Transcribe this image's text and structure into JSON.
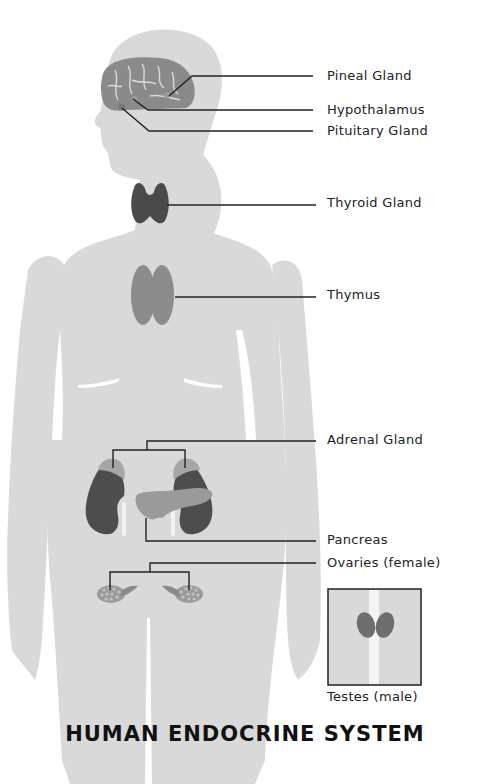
{
  "title": "HUMAN ENDOCRINE SYSTEM",
  "labels": {
    "pineal": "Pineal Gland",
    "hypothalamus": "Hypothalamus",
    "pituitary": "Pituitary Gland",
    "thyroid": "Thyroid Gland",
    "thymus": "Thymus",
    "adrenal": "Adrenal Gland",
    "pancreas": "Pancreas",
    "ovaries": "Ovaries (female)",
    "testes": "Testes (male)"
  },
  "colors": {
    "silhouette": "#d9d9d9",
    "brain": "#8a8a8a",
    "thyroid": "#4a4a4a",
    "thymus": "#8c8c8c",
    "kidney": "#4d4d4d",
    "adrenal": "#a6a6a6",
    "pancreas": "#9a9a9a",
    "leader_line": "#222222"
  }
}
